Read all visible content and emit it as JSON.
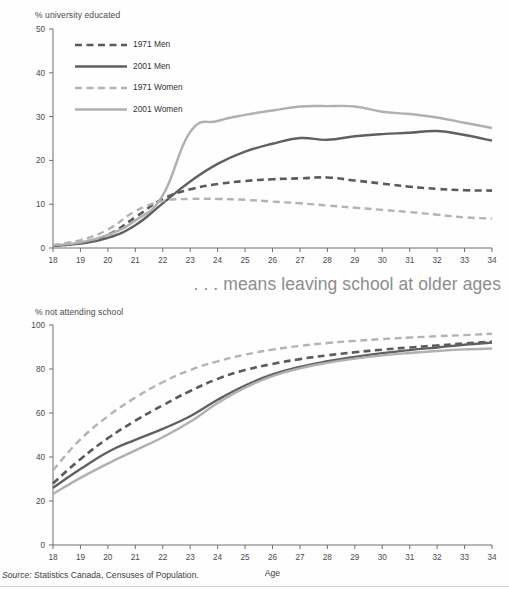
{
  "figure": {
    "mid_caption": ". . . means leaving school at older ages",
    "source_label": "Source:",
    "source_text": " Statistics Canada, Censuses of Population."
  },
  "colors": {
    "men_1971": "#5a5a5a",
    "men_2001": "#606060",
    "women_1971": "#b3b3b3",
    "women_2001": "#b0b0b0",
    "axis": "#6f6f6f",
    "text": "#3d3d3d",
    "caption": "#8d8d8d"
  },
  "chart_data": [
    {
      "id": "top",
      "type": "line",
      "title": "% university educated",
      "xlabel": "",
      "ylabel": "% university educated",
      "x": [
        18,
        19,
        20,
        21,
        22,
        23,
        24,
        25,
        26,
        27,
        28,
        29,
        30,
        31,
        32,
        33,
        34
      ],
      "xlim": [
        18,
        34
      ],
      "ylim": [
        0,
        50
      ],
      "yticks": [
        0,
        10,
        20,
        30,
        40,
        50
      ],
      "xticks": [
        18,
        19,
        20,
        21,
        22,
        23,
        24,
        25,
        26,
        27,
        28,
        29,
        30,
        31,
        32,
        33,
        34
      ],
      "grid": false,
      "legend_position": "upper-left",
      "series": [
        {
          "name": "1971 Men",
          "style": "dashed",
          "color": "#5a5a5a",
          "width": 2.6,
          "values": [
            0.5,
            1.2,
            3.0,
            7.0,
            11.2,
            13.4,
            14.6,
            15.3,
            15.7,
            15.9,
            16.1,
            15.4,
            14.7,
            14.0,
            13.5,
            13.2,
            13.1
          ]
        },
        {
          "name": "2001 Men",
          "style": "solid",
          "color": "#606060",
          "width": 2.4,
          "values": [
            0.5,
            1.0,
            2.3,
            5.2,
            10.2,
            15.2,
            19.2,
            22.0,
            23.8,
            25.1,
            24.7,
            25.5,
            26.0,
            26.3,
            26.7,
            25.8,
            24.5
          ]
        },
        {
          "name": "1971 Women",
          "style": "dashed",
          "color": "#b3b3b3",
          "width": 2.4,
          "values": [
            0.7,
            1.8,
            4.2,
            8.4,
            10.7,
            11.2,
            11.2,
            11.0,
            10.6,
            10.2,
            9.7,
            9.2,
            8.7,
            8.2,
            7.6,
            7.0,
            6.7
          ]
        },
        {
          "name": "2001 Women",
          "style": "solid",
          "color": "#b0b0b0",
          "width": 2.4,
          "values": [
            0.6,
            1.3,
            3.0,
            6.3,
            12.0,
            26.5,
            29.0,
            30.4,
            31.4,
            32.3,
            32.4,
            32.3,
            31.1,
            30.6,
            29.8,
            28.6,
            27.4
          ]
        }
      ]
    },
    {
      "id": "bottom",
      "type": "line",
      "title": "% not attending school",
      "xlabel": "Age",
      "ylabel": "% not attending school",
      "x": [
        18,
        19,
        20,
        21,
        22,
        23,
        24,
        25,
        26,
        27,
        28,
        29,
        30,
        31,
        32,
        33,
        34
      ],
      "xlim": [
        18,
        34
      ],
      "ylim": [
        0,
        100
      ],
      "yticks": [
        0,
        20,
        40,
        60,
        80,
        100
      ],
      "xticks": [
        18,
        19,
        20,
        21,
        22,
        23,
        24,
        25,
        26,
        27,
        28,
        29,
        30,
        31,
        32,
        33,
        34
      ],
      "grid": false,
      "legend_position": "none",
      "series": [
        {
          "name": "1971 Men",
          "style": "dashed",
          "color": "#5a5a5a",
          "width": 2.6,
          "values": [
            28.0,
            39.0,
            48.5,
            56.5,
            63.5,
            70.0,
            75.5,
            79.5,
            82.3,
            84.5,
            86.2,
            87.6,
            88.8,
            89.8,
            90.7,
            91.6,
            92.4
          ]
        },
        {
          "name": "2001 Men",
          "style": "solid",
          "color": "#606060",
          "width": 2.4,
          "values": [
            26.0,
            34.5,
            42.3,
            47.8,
            52.8,
            58.5,
            66.0,
            72.5,
            77.5,
            81.0,
            83.5,
            85.5,
            87.2,
            88.6,
            89.8,
            91.0,
            92.0
          ]
        },
        {
          "name": "1971 Women",
          "style": "dashed",
          "color": "#b3b3b3",
          "width": 2.4,
          "values": [
            34.0,
            48.0,
            58.5,
            67.0,
            74.0,
            79.5,
            83.5,
            86.5,
            88.8,
            90.5,
            91.8,
            92.8,
            93.6,
            94.3,
            94.9,
            95.4,
            96.0
          ]
        },
        {
          "name": "2001 Women",
          "style": "solid",
          "color": "#b0b0b0",
          "width": 2.4,
          "values": [
            23.2,
            30.5,
            37.0,
            43.0,
            49.0,
            56.0,
            64.5,
            71.5,
            76.8,
            80.3,
            82.8,
            84.7,
            86.2,
            87.3,
            88.2,
            88.9,
            89.3
          ]
        }
      ]
    }
  ]
}
